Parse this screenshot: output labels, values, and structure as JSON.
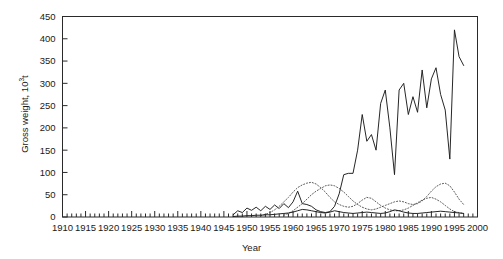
{
  "chart_data": {
    "type": "line",
    "title": "",
    "xlabel": "Year",
    "ylabel": "Gross weight, 10",
    "ylabel_superscript": "3",
    "ylabel_unit": "t",
    "ylabel_full": "Gross weight, 10³t",
    "xlim": [
      1910,
      2000
    ],
    "ylim": [
      0,
      450
    ],
    "xticks": [
      1910,
      1915,
      1920,
      1925,
      1930,
      1935,
      1940,
      1945,
      1950,
      1955,
      1960,
      1965,
      1970,
      1975,
      1980,
      1985,
      1990,
      1995,
      2000
    ],
    "xticklabels": [
      "1910",
      "1915",
      "1920",
      "1925",
      "1930",
      "1935",
      "1940",
      "1945",
      "1950",
      "1955",
      "1960",
      "1965",
      "1970",
      "1975",
      "1980",
      "1985",
      "1990",
      "1995",
      "2000"
    ],
    "xminor_tick_interval": 1,
    "yticks": [
      0,
      50,
      100,
      150,
      200,
      250,
      300,
      350,
      400,
      450
    ],
    "yticklabels": [
      "0",
      "50",
      "100",
      "150",
      "200",
      "250",
      "300",
      "350",
      "400",
      "450"
    ],
    "grid": false,
    "legend": "none",
    "frame": "box",
    "line_color": "#1a1a1a",
    "background": "#ffffff",
    "series": [
      {
        "name": "series-1-solid-major",
        "style": "solid",
        "color": "#1a1a1a",
        "x": [
          1947,
          1948,
          1949,
          1950,
          1951,
          1952,
          1953,
          1954,
          1955,
          1956,
          1957,
          1958,
          1959,
          1960,
          1961,
          1962,
          1963,
          1964,
          1965,
          1966,
          1967,
          1968,
          1969,
          1970,
          1971,
          1972,
          1973,
          1974,
          1975,
          1976,
          1977,
          1978,
          1979,
          1980,
          1981,
          1982,
          1983,
          1984,
          1985,
          1986,
          1987,
          1988,
          1989,
          1990,
          1991,
          1992,
          1993,
          1994,
          1995,
          1996,
          1997
        ],
        "values": [
          5,
          14,
          10,
          20,
          15,
          22,
          14,
          24,
          17,
          27,
          19,
          30,
          21,
          34,
          58,
          30,
          28,
          24,
          16,
          12,
          10,
          12,
          24,
          52,
          95,
          98,
          98,
          150,
          230,
          170,
          185,
          150,
          255,
          285,
          200,
          95,
          285,
          300,
          230,
          270,
          235,
          330,
          245,
          310,
          335,
          275,
          240,
          130,
          420,
          360,
          340
        ]
      },
      {
        "name": "series-2-dotted-early",
        "style": "dotted",
        "color": "#4a4a4a",
        "x": [
          1953,
          1954,
          1955,
          1956,
          1957,
          1958,
          1959,
          1960,
          1961,
          1962,
          1963,
          1964,
          1965,
          1966,
          1967,
          1968,
          1969,
          1970,
          1971,
          1972,
          1973,
          1974,
          1975,
          1976,
          1977,
          1978,
          1979,
          1980,
          1981,
          1982,
          1983,
          1984,
          1985,
          1986,
          1987,
          1988,
          1989,
          1990,
          1991,
          1992,
          1993,
          1994,
          1995,
          1996,
          1997
        ],
        "values": [
          3,
          6,
          10,
          16,
          24,
          34,
          44,
          56,
          66,
          72,
          76,
          78,
          74,
          66,
          56,
          44,
          34,
          28,
          24,
          22,
          24,
          30,
          38,
          44,
          42,
          34,
          26,
          20,
          16,
          14,
          14,
          16,
          20,
          26,
          32,
          38,
          42,
          44,
          40,
          34,
          26,
          18,
          12,
          10,
          8
        ]
      },
      {
        "name": "series-3-dotted-late",
        "style": "dotted",
        "color": "#4a4a4a",
        "x": [
          1958,
          1959,
          1960,
          1961,
          1962,
          1963,
          1964,
          1965,
          1966,
          1967,
          1968,
          1969,
          1970,
          1971,
          1972,
          1973,
          1974,
          1975,
          1976,
          1977,
          1978,
          1979,
          1980,
          1981,
          1982,
          1983,
          1984,
          1985,
          1986,
          1987,
          1988,
          1989,
          1990,
          1991,
          1992,
          1993,
          1994,
          1995,
          1996,
          1997
        ],
        "values": [
          4,
          8,
          14,
          22,
          30,
          40,
          50,
          58,
          64,
          70,
          72,
          70,
          64,
          56,
          46,
          36,
          28,
          22,
          18,
          16,
          18,
          22,
          26,
          30,
          34,
          36,
          34,
          30,
          28,
          30,
          36,
          46,
          58,
          68,
          74,
          76,
          70,
          56,
          40,
          28
        ]
      },
      {
        "name": "series-4-solid-minor",
        "style": "solid",
        "color": "#1a1a1a",
        "x": [
          1947,
          1948,
          1949,
          1950,
          1951,
          1952,
          1953,
          1954,
          1955,
          1956,
          1957,
          1958,
          1959,
          1960,
          1961,
          1962,
          1963,
          1964,
          1965,
          1966,
          1967,
          1968,
          1969,
          1970,
          1971,
          1972,
          1973,
          1974,
          1975,
          1976,
          1977,
          1978,
          1979,
          1980,
          1981,
          1982,
          1983,
          1984,
          1985,
          1986,
          1987,
          1988,
          1989,
          1990,
          1991,
          1992,
          1993,
          1994,
          1995,
          1996,
          1997
        ],
        "values": [
          1,
          2,
          2,
          3,
          3,
          4,
          4,
          5,
          5,
          6,
          7,
          8,
          9,
          11,
          14,
          17,
          16,
          14,
          12,
          10,
          9,
          11,
          14,
          12,
          10,
          9,
          8,
          9,
          10,
          11,
          10,
          9,
          8,
          9,
          12,
          16,
          14,
          11,
          9,
          8,
          8,
          9,
          10,
          11,
          12,
          13,
          12,
          11,
          10,
          9,
          8
        ]
      }
    ]
  }
}
